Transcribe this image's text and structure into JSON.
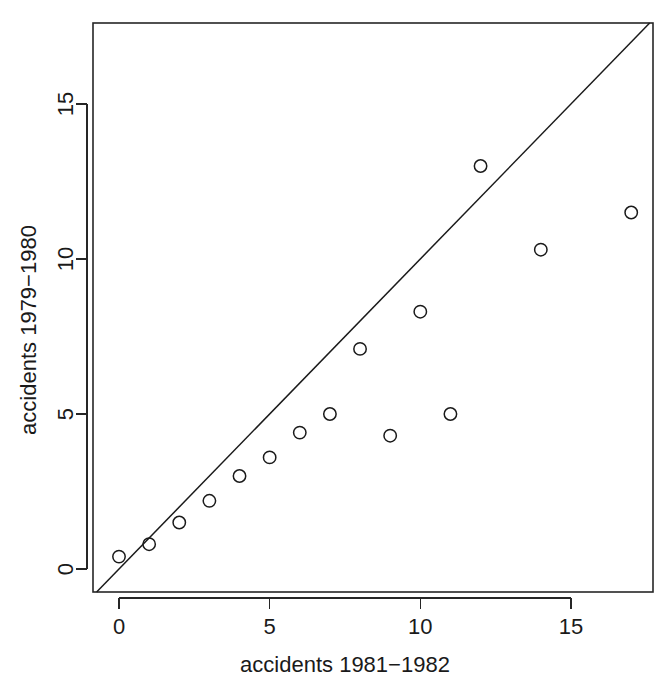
{
  "chart_data": {
    "type": "scatter",
    "title": "",
    "subtitle": "",
    "xlabel": "accidents 1981−1982",
    "ylabel": "accidents 1979−1980",
    "xlim": [
      -0.8,
      17.8
    ],
    "ylim": [
      -0.8,
      17.8
    ],
    "xticks": [
      0,
      5,
      10,
      15
    ],
    "yticks": [
      0,
      5,
      10,
      15
    ],
    "xticklabels": [
      "0",
      "5",
      "10",
      "15"
    ],
    "yticklabels": [
      "0",
      "5",
      "10",
      "15"
    ],
    "grid": false,
    "legend": null,
    "legend_position": "none",
    "point_marker": "open-circle",
    "point_color": "#1a1a1a",
    "axis_color": "#262626",
    "background_color": "#ffffff",
    "annotations": [
      {
        "name": "identity-reference-line",
        "type": "line",
        "description": "y = x diagonal reference line",
        "slope": 1,
        "intercept": 0,
        "color": "#1a1a1a"
      }
    ],
    "points": [
      {
        "x": 0,
        "y": 0.4
      },
      {
        "x": 1,
        "y": 0.8
      },
      {
        "x": 2,
        "y": 1.5
      },
      {
        "x": 3,
        "y": 2.2
      },
      {
        "x": 4,
        "y": 3.0
      },
      {
        "x": 5,
        "y": 3.6
      },
      {
        "x": 6,
        "y": 4.4
      },
      {
        "x": 7,
        "y": 5.0
      },
      {
        "x": 8,
        "y": 7.1
      },
      {
        "x": 9,
        "y": 4.3
      },
      {
        "x": 10,
        "y": 8.3
      },
      {
        "x": 11,
        "y": 5.0
      },
      {
        "x": 12,
        "y": 13.0
      },
      {
        "x": 14,
        "y": 10.3
      },
      {
        "x": 17,
        "y": 11.5
      }
    ],
    "x": [
      0,
      1,
      2,
      3,
      4,
      5,
      6,
      7,
      8,
      9,
      10,
      11,
      12,
      14,
      17
    ],
    "values": [
      0.4,
      0.8,
      1.5,
      2.2,
      3.0,
      3.6,
      4.4,
      5.0,
      7.1,
      4.3,
      8.3,
      5.0,
      13.0,
      10.3,
      11.5
    ]
  }
}
